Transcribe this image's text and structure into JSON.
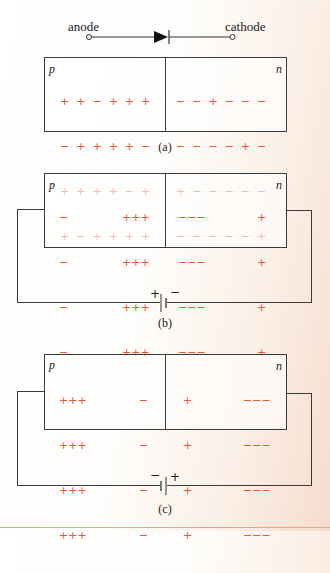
{
  "diode_symbol": {
    "anode_label": "anode",
    "cathode_label": "cathode"
  },
  "panels": [
    {
      "caption": "(a)",
      "p_label": "p",
      "n_label": "n",
      "p_rows": [
        "+  +  −  +  +  +",
        "−  +  +  +  +  −",
        "+  +  +  +  −  +",
        "+  −  +  +  +  +"
      ],
      "n_rows": [
        "−  −  +  −  −  −",
        "−  −  −  −  +  −",
        "+  −  −  −  −  −",
        "−  −  −  −  −  +"
      ],
      "battery": null
    },
    {
      "caption": "(b)",
      "p_label": "p",
      "n_label": "n",
      "p_left_rows": [
        "−",
        "−",
        "−",
        "−"
      ],
      "p_right_rows": [
        "+++",
        "+++",
        "+++",
        "+++"
      ],
      "n_left_rows": [
        "−−−",
        "−−−",
        "−−−",
        "−−−"
      ],
      "n_right_rows": [
        "+",
        "+",
        "+",
        "+"
      ],
      "battery": {
        "left_sign": "+",
        "right_sign": "−"
      }
    },
    {
      "caption": "(c)",
      "p_label": "p",
      "n_label": "n",
      "p_left_rows": [
        "+++",
        "+++",
        "+++",
        "+++"
      ],
      "p_right_rows": [
        "−",
        "−",
        "−",
        "−"
      ],
      "n_left_rows": [
        "+",
        "+",
        "+",
        "+"
      ],
      "n_right_rows": [
        "−−−",
        "−−−",
        "−−−",
        "−−−"
      ],
      "battery": {
        "left_sign": "−",
        "right_sign": "+"
      }
    }
  ],
  "colors": {
    "charge": "#e8572f",
    "line": "#3a3a3a"
  }
}
